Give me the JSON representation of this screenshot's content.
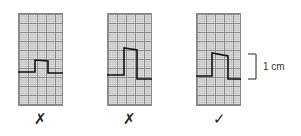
{
  "panels": [
    {
      "id": "panel-1",
      "verdict": "✗",
      "verdict_meaning": "incorrect"
    },
    {
      "id": "panel-2",
      "verdict": "✗",
      "verdict_meaning": "incorrect"
    },
    {
      "id": "panel-3",
      "verdict": "✓",
      "verdict_meaning": "correct"
    }
  ],
  "scale_label": "1 cm",
  "colors": {
    "grid_major": "#8a8a8a",
    "grid_minor": "#c4c4c4",
    "trace": "#111111"
  }
}
